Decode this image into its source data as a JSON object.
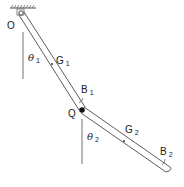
{
  "diagram": {
    "type": "double pendulum",
    "pivot_label": "O",
    "joint_label": "Q",
    "rod1": {
      "angle_symbol": "θ",
      "angle_subscript": "1",
      "center_of_mass_label": "G",
      "center_of_mass_subscript": "1",
      "body_label": "B",
      "body_subscript": "1"
    },
    "rod2": {
      "angle_symbol": "θ",
      "angle_subscript": "2",
      "center_of_mass_label": "G",
      "center_of_mass_subscript": "2",
      "body_label": "B",
      "body_subscript": "2"
    },
    "colors": {
      "line": "#4a4a4a",
      "reference_line": "#8a8a8a",
      "joint": "#111111"
    }
  }
}
